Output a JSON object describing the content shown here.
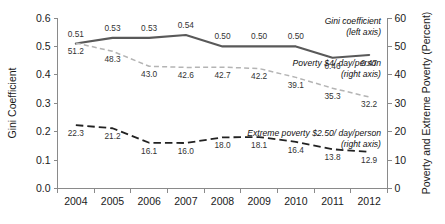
{
  "chart_data": {
    "type": "line",
    "title": "",
    "xlabel": "",
    "ylabel": "Gini Coefficient",
    "y2label": "Poverty and Extreme Poverty (Percent)",
    "categories": [
      "2004",
      "2005",
      "2006",
      "2007",
      "2008",
      "2009",
      "2010",
      "2011",
      "2012"
    ],
    "x": [
      2004,
      2005,
      2006,
      2007,
      2008,
      2009,
      2010,
      2011,
      2012
    ],
    "ylim": [
      0.0,
      0.6
    ],
    "y2lim": [
      0,
      60
    ],
    "yticks": [
      "0.0",
      "0.1",
      "0.2",
      "0.3",
      "0.4",
      "0.5",
      "0.6"
    ],
    "ytick_values": [
      0.0,
      0.1,
      0.2,
      0.3,
      0.4,
      0.5,
      0.6
    ],
    "y2ticks": [
      "0",
      "10",
      "20",
      "30",
      "40",
      "50",
      "60"
    ],
    "y2tick_values": [
      0,
      10,
      20,
      30,
      40,
      50,
      60
    ],
    "grid": false,
    "legend_position": "inline-annotations",
    "series": [
      {
        "name": "Gini coefficient",
        "axis": "left",
        "style": "solid",
        "color": "#595959",
        "values": [
          0.51,
          0.53,
          0.53,
          0.54,
          0.5,
          0.5,
          0.5,
          0.46,
          0.47
        ],
        "labels": [
          "0.51",
          "0.53",
          "0.53",
          "0.54",
          "0.50",
          "0.50",
          "0.50",
          "0.46",
          "0.47"
        ],
        "label_positions": [
          "above",
          "above",
          "above",
          "above",
          "above",
          "above",
          "above",
          "below",
          "below"
        ],
        "annotation": [
          "Gini coefficient",
          "(left axis)"
        ]
      },
      {
        "name": "Poverty $4/ day/person",
        "axis": "right",
        "style": "dashed-light",
        "color": "#b4b4b4",
        "values": [
          51.2,
          48.3,
          43.0,
          42.6,
          42.7,
          42.2,
          39.1,
          35.3,
          32.2
        ],
        "labels": [
          "51.2",
          "48.3",
          "43.0",
          "42.6",
          "42.7",
          "42.2",
          "39.1",
          "35.3",
          "32.2"
        ],
        "label_positions": [
          "below",
          "below",
          "below",
          "below",
          "below",
          "below",
          "below",
          "below",
          "below"
        ],
        "annotation": [
          "Poverty $4/ day/person",
          "(right axis)"
        ]
      },
      {
        "name": "Extreme poverty $2.50/ day/person",
        "axis": "right",
        "style": "dashed-dark",
        "color": "#222222",
        "values": [
          22.3,
          21.2,
          16.1,
          16.0,
          18.0,
          18.1,
          16.4,
          13.8,
          12.9
        ],
        "labels": [
          "22.3",
          "21.2",
          "16.1",
          "16.0",
          "18.0",
          "18.1",
          "16.4",
          "13.8",
          "12.9"
        ],
        "label_positions": [
          "below",
          "below",
          "below",
          "below",
          "below",
          "below",
          "below",
          "below",
          "below"
        ],
        "annotation": [
          "Extreme poverty $2.50/ day/person",
          "(right axis)"
        ]
      }
    ]
  },
  "axes": {
    "left_title": "Gini Coefficient",
    "right_title": "Poverty and Extreme Poverty (Percent)"
  },
  "annotations": {
    "gini_line1": "Gini coefficient",
    "gini_line2": "(left axis)",
    "poverty_line1": "Poverty $4/ day/person",
    "poverty_line2": "(right axis)",
    "extreme_line1": "Extreme poverty $2.50/ day/person",
    "extreme_line2": "(right axis)"
  }
}
